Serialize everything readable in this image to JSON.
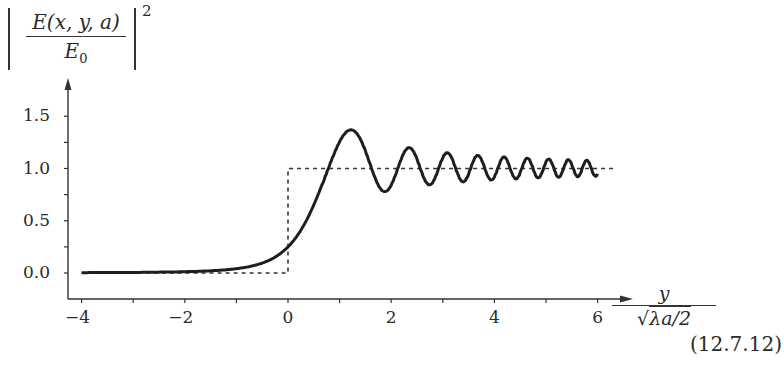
{
  "chart_data": {
    "type": "line",
    "title": "",
    "ylabel": "|E(x, y, a) / E0|^2",
    "ylabel_parts": {
      "numerator": "E(x, y, a)",
      "denominator": "E",
      "denominator_sub": "0",
      "exponent": "2"
    },
    "xlabel": "y / sqrt(λa/2)",
    "xlabel_parts": {
      "numerator": "y",
      "denominator": "√λa/2"
    },
    "xlim": [
      -4,
      6.3
    ],
    "ylim": [
      0,
      1.7
    ],
    "xticks": [
      -4,
      -2,
      0,
      2,
      4,
      6
    ],
    "xtick_labels": [
      "−4",
      "−2",
      "0",
      "2",
      "4",
      "6"
    ],
    "xminor_ticks": [
      -3,
      -1,
      1,
      3,
      5
    ],
    "yticks": [
      0.0,
      0.5,
      1.0,
      1.5
    ],
    "ytick_labels": [
      "0.0",
      "0.5",
      "1.0",
      "1.5"
    ],
    "yminor_ticks": [
      0.25,
      0.75,
      1.25
    ],
    "grid": false,
    "legend": null,
    "annotation": "(12.7.12)",
    "series": [
      {
        "name": "Fresnel straight-edge diffraction intensity",
        "style": "solid",
        "x": [
          -4,
          -3,
          -2,
          -1.5,
          -1,
          -0.5,
          0,
          0.5,
          1.0,
          1.22,
          1.5,
          1.87,
          2.0,
          2.34,
          2.5,
          2.74,
          3.0,
          3.08,
          3.4,
          3.7,
          4.0,
          4.3,
          4.6,
          5.0,
          5.4,
          5.7,
          6.0
        ],
        "values": [
          0.005,
          0.009,
          0.02,
          0.035,
          0.07,
          0.14,
          0.25,
          0.55,
          1.07,
          1.37,
          1.2,
          0.78,
          0.84,
          1.2,
          1.0,
          0.84,
          1.1,
          1.15,
          0.87,
          1.12,
          0.9,
          1.1,
          0.91,
          1.09,
          0.92,
          1.07,
          0.97
        ]
      },
      {
        "name": "Geometric shadow (step)",
        "style": "dashed",
        "x": [
          -4,
          0,
          0,
          6.3
        ],
        "values": [
          0,
          0,
          1,
          1
        ]
      }
    ]
  }
}
